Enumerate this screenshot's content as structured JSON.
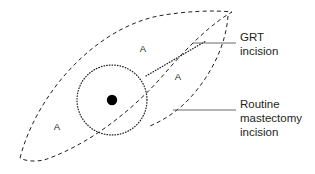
{
  "figure": {
    "background_color": "#ffffff",
    "ink_color": "#231f20",
    "leader_color": "#58595b",
    "width": 315,
    "height": 174
  },
  "region_labels": [
    {
      "id": "region-upper",
      "text": "A",
      "x": 143,
      "y": 52
    },
    {
      "id": "region-right",
      "text": "A",
      "x": 178,
      "y": 80
    },
    {
      "id": "region-left",
      "text": "A",
      "x": 57,
      "y": 130
    }
  ],
  "callouts": [
    {
      "id": "grt-incision",
      "lines": [
        "GRT",
        "incision"
      ],
      "text": "GRT incision",
      "leader": {
        "x1": 193,
        "y1": 43,
        "x2": 236,
        "y2": 43
      },
      "label_x": 240,
      "label_y": 40
    },
    {
      "id": "routine-mastectomy-incision",
      "lines": [
        "Routine",
        "mastectomy",
        "incision"
      ],
      "text": "Routine mastectomy incision",
      "leader": {
        "x1": 173,
        "y1": 110,
        "x2": 236,
        "y2": 110
      },
      "label_x": 240,
      "label_y": 107
    }
  ],
  "shapes": {
    "routine_incision_outline": {
      "name": "routine-mastectomy-ellipse",
      "style": "dashed",
      "path": "M 20,158 C 36,96 92,30 158,16 C 186,11 214,10 232,12 C 214,22 190,44 166,72 C 132,112 86,146 44,160 C 34,162 25,161 20,158 Z"
    },
    "grt_inner_arc": {
      "name": "grt-inner-boundary-arc",
      "style": "dashed",
      "path": "M 228,16 C 226,44 212,74 190,98 C 178,111 164,120 150,126"
    },
    "grt_incision_line": {
      "name": "grt-incision-dotted-line",
      "style": "dotted",
      "path": "M 146,76 L 206,41"
    },
    "areola_circle": {
      "name": "areola-dotted-circle",
      "style": "dotted",
      "cx": 112,
      "cy": 100,
      "r": 35
    },
    "nipple": {
      "name": "nipple-dot",
      "style": "solid-fill",
      "cx": 112,
      "cy": 100,
      "r": 5.2
    }
  }
}
